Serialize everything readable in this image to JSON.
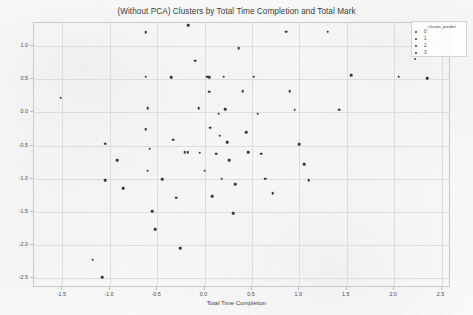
{
  "chart_data": {
    "type": "scatter",
    "title": "(Without PCA) Clusters by Total Time Completion and Total Mark",
    "xlabel": "Total Time Completion",
    "ylabel": "Total Mark",
    "xlim": [
      -1.8,
      2.6
    ],
    "ylim": [
      -2.65,
      1.35
    ],
    "xticks": [
      -1.5,
      -1.0,
      -0.5,
      0.0,
      0.5,
      1.0,
      1.5,
      2.0,
      2.5
    ],
    "xticklabels": [
      "-1.5",
      "-1.0",
      "-0.5",
      "0.0",
      "0.5",
      "1.0",
      "1.5",
      "2.0",
      "2.5"
    ],
    "yticks": [
      1.0,
      0.5,
      0.0,
      -0.5,
      -1.0,
      -1.5,
      -2.0,
      -2.5
    ],
    "yticklabels": [
      "1.0",
      "0.5",
      "0.0",
      "-0.5",
      "-1.0",
      "-1.5",
      "-2.0",
      "-2.5"
    ],
    "grid": true,
    "legend": {
      "title": "cluster_predict",
      "position": "upper right outside",
      "entries": [
        "0",
        "1",
        "2",
        "3"
      ]
    },
    "marker_color": "#35353c",
    "points": [
      {
        "x": -1.52,
        "y": 0.22
      },
      {
        "x": -1.05,
        "y": -0.47
      },
      {
        "x": -0.92,
        "y": -0.72
      },
      {
        "x": -1.05,
        "y": -1.02
      },
      {
        "x": -0.86,
        "y": -1.14
      },
      {
        "x": -1.18,
        "y": -2.22
      },
      {
        "x": -1.08,
        "y": -2.49
      },
      {
        "x": -0.62,
        "y": 1.21
      },
      {
        "x": -0.62,
        "y": 0.54
      },
      {
        "x": -0.6,
        "y": 0.06
      },
      {
        "x": -0.62,
        "y": -0.25
      },
      {
        "x": -0.58,
        "y": -0.55
      },
      {
        "x": -0.6,
        "y": -0.88
      },
      {
        "x": -0.55,
        "y": -1.49
      },
      {
        "x": -0.52,
        "y": -1.76
      },
      {
        "x": -0.45,
        "y": -1.01
      },
      {
        "x": -0.35,
        "y": 0.53
      },
      {
        "x": -0.33,
        "y": -0.41
      },
      {
        "x": -0.3,
        "y": -1.29
      },
      {
        "x": -0.26,
        "y": -2.05
      },
      {
        "x": -0.21,
        "y": -0.6
      },
      {
        "x": -0.18,
        "y": -0.6
      },
      {
        "x": -0.17,
        "y": 1.32
      },
      {
        "x": -0.1,
        "y": 0.78
      },
      {
        "x": -0.06,
        "y": 0.06
      },
      {
        "x": -0.05,
        "y": -0.61
      },
      {
        "x": 0.0,
        "y": -0.88
      },
      {
        "x": 0.03,
        "y": 0.54
      },
      {
        "x": 0.05,
        "y": 0.53
      },
      {
        "x": 0.05,
        "y": 0.31
      },
      {
        "x": 0.06,
        "y": -0.23
      },
      {
        "x": 0.08,
        "y": -1.26
      },
      {
        "x": 0.12,
        "y": -0.62
      },
      {
        "x": 0.15,
        "y": -0.02
      },
      {
        "x": 0.16,
        "y": -0.35
      },
      {
        "x": 0.18,
        "y": -1.0
      },
      {
        "x": 0.2,
        "y": 0.54
      },
      {
        "x": 0.22,
        "y": 0.05
      },
      {
        "x": 0.24,
        "y": -0.45
      },
      {
        "x": 0.26,
        "y": -0.72
      },
      {
        "x": 0.3,
        "y": -1.52
      },
      {
        "x": 0.32,
        "y": -1.08
      },
      {
        "x": 0.36,
        "y": 0.97
      },
      {
        "x": 0.4,
        "y": 0.32
      },
      {
        "x": 0.44,
        "y": -0.3
      },
      {
        "x": 0.46,
        "y": -0.6
      },
      {
        "x": 0.52,
        "y": 0.54
      },
      {
        "x": 0.56,
        "y": -0.02
      },
      {
        "x": 0.6,
        "y": -0.62
      },
      {
        "x": 0.64,
        "y": -1.0
      },
      {
        "x": 0.72,
        "y": -1.22
      },
      {
        "x": 0.86,
        "y": 1.22
      },
      {
        "x": 0.9,
        "y": 0.32
      },
      {
        "x": 0.95,
        "y": 0.04
      },
      {
        "x": 1.0,
        "y": -0.48
      },
      {
        "x": 1.05,
        "y": -0.78
      },
      {
        "x": 1.1,
        "y": -1.02
      },
      {
        "x": 1.3,
        "y": 1.22
      },
      {
        "x": 1.42,
        "y": 0.04
      },
      {
        "x": 1.55,
        "y": 0.56
      },
      {
        "x": 2.05,
        "y": 0.54
      },
      {
        "x": 2.35,
        "y": 0.52
      }
    ]
  }
}
